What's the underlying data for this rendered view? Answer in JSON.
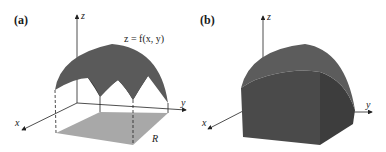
{
  "figure": {
    "panels": [
      {
        "id": "a",
        "label": "(a)",
        "axes": {
          "z": "z",
          "x": "x",
          "y": "y"
        },
        "surface_label": "z = f(x, y)",
        "region_label": "R"
      },
      {
        "id": "b",
        "label": "(b)",
        "axes": {
          "z": "z",
          "x": "x",
          "y": "y"
        }
      }
    ],
    "colors": {
      "surface": "#5a5a5a",
      "surface_inner": "#3a3a3a",
      "region": "#a8a8a8",
      "solid_front": "#4a4a4a",
      "solid_top": "#5c5c5c",
      "solid_side": "#3d3d3d",
      "axis": "#222222"
    }
  }
}
